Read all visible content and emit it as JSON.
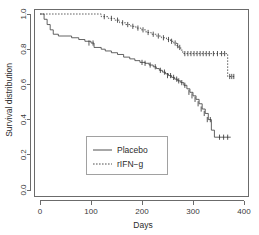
{
  "chart_data": {
    "type": "line",
    "title": "",
    "xlabel": "Days",
    "ylabel": "Survival distribution",
    "xlim": [
      0,
      400
    ],
    "ylim": [
      0.0,
      1.0
    ],
    "xticks": [
      "0",
      "100",
      "200",
      "300",
      "400"
    ],
    "xtick_values": [
      0,
      100,
      200,
      300,
      400
    ],
    "yticks": [
      "0.0",
      "0.2",
      "0.4",
      "0.6",
      "0.8",
      "1.0"
    ],
    "ytick_values": [
      0.0,
      0.2,
      0.4,
      0.6,
      0.8,
      1.0
    ],
    "grid": false,
    "legend_position": "center-left",
    "series": [
      {
        "name": "Placebo",
        "style": "solid",
        "steps": [
          [
            0,
            1.0
          ],
          [
            8,
            0.97
          ],
          [
            14,
            0.94
          ],
          [
            20,
            0.91
          ],
          [
            26,
            0.885
          ],
          [
            36,
            0.875
          ],
          [
            62,
            0.865
          ],
          [
            76,
            0.855
          ],
          [
            88,
            0.845
          ],
          [
            100,
            0.835
          ],
          [
            106,
            0.81
          ],
          [
            120,
            0.8
          ],
          [
            128,
            0.79
          ],
          [
            140,
            0.78
          ],
          [
            152,
            0.77
          ],
          [
            164,
            0.755
          ],
          [
            176,
            0.745
          ],
          [
            186,
            0.735
          ],
          [
            196,
            0.725
          ],
          [
            206,
            0.72
          ],
          [
            214,
            0.71
          ],
          [
            222,
            0.7
          ],
          [
            228,
            0.69
          ],
          [
            234,
            0.68
          ],
          [
            240,
            0.67
          ],
          [
            246,
            0.66
          ],
          [
            252,
            0.65
          ],
          [
            258,
            0.64
          ],
          [
            264,
            0.63
          ],
          [
            270,
            0.62
          ],
          [
            276,
            0.61
          ],
          [
            282,
            0.595
          ],
          [
            288,
            0.575
          ],
          [
            294,
            0.555
          ],
          [
            300,
            0.535
          ],
          [
            306,
            0.515
          ],
          [
            312,
            0.49
          ],
          [
            318,
            0.46
          ],
          [
            324,
            0.435
          ],
          [
            330,
            0.4
          ],
          [
            336,
            0.34
          ],
          [
            342,
            0.3
          ],
          [
            374,
            0.3
          ]
        ],
        "censored": [
          [
            96,
            0.835
          ],
          [
            104,
            0.835
          ],
          [
            200,
            0.725
          ],
          [
            206,
            0.72
          ],
          [
            216,
            0.71
          ],
          [
            226,
            0.7
          ],
          [
            236,
            0.68
          ],
          [
            244,
            0.67
          ],
          [
            250,
            0.65
          ],
          [
            256,
            0.65
          ],
          [
            262,
            0.64
          ],
          [
            268,
            0.63
          ],
          [
            272,
            0.62
          ],
          [
            278,
            0.61
          ],
          [
            284,
            0.595
          ],
          [
            292,
            0.555
          ],
          [
            298,
            0.535
          ],
          [
            304,
            0.515
          ],
          [
            310,
            0.49
          ],
          [
            316,
            0.46
          ],
          [
            322,
            0.435
          ],
          [
            328,
            0.4
          ],
          [
            334,
            0.4
          ],
          [
            352,
            0.3
          ],
          [
            360,
            0.3
          ],
          [
            368,
            0.3
          ]
        ]
      },
      {
        "name": "rIFN-g",
        "style": "dashed",
        "steps": [
          [
            0,
            1.0
          ],
          [
            108,
            1.0
          ],
          [
            120,
            0.985
          ],
          [
            134,
            0.975
          ],
          [
            146,
            0.965
          ],
          [
            156,
            0.95
          ],
          [
            168,
            0.94
          ],
          [
            178,
            0.93
          ],
          [
            188,
            0.92
          ],
          [
            198,
            0.91
          ],
          [
            208,
            0.895
          ],
          [
            218,
            0.885
          ],
          [
            228,
            0.875
          ],
          [
            238,
            0.865
          ],
          [
            248,
            0.855
          ],
          [
            256,
            0.845
          ],
          [
            262,
            0.835
          ],
          [
            268,
            0.82
          ],
          [
            272,
            0.81
          ],
          [
            276,
            0.795
          ],
          [
            280,
            0.775
          ],
          [
            364,
            0.775
          ],
          [
            368,
            0.645
          ],
          [
            382,
            0.645
          ]
        ],
        "censored": [
          [
            126,
            0.985
          ],
          [
            140,
            0.975
          ],
          [
            152,
            0.965
          ],
          [
            162,
            0.95
          ],
          [
            172,
            0.94
          ],
          [
            182,
            0.93
          ],
          [
            192,
            0.92
          ],
          [
            202,
            0.91
          ],
          [
            212,
            0.895
          ],
          [
            222,
            0.885
          ],
          [
            232,
            0.875
          ],
          [
            242,
            0.865
          ],
          [
            252,
            0.855
          ],
          [
            258,
            0.845
          ],
          [
            265,
            0.835
          ],
          [
            270,
            0.82
          ],
          [
            274,
            0.81
          ],
          [
            284,
            0.775
          ],
          [
            290,
            0.775
          ],
          [
            296,
            0.775
          ],
          [
            302,
            0.775
          ],
          [
            308,
            0.775
          ],
          [
            314,
            0.775
          ],
          [
            320,
            0.775
          ],
          [
            326,
            0.775
          ],
          [
            332,
            0.775
          ],
          [
            340,
            0.775
          ],
          [
            348,
            0.775
          ],
          [
            356,
            0.775
          ],
          [
            362,
            0.775
          ],
          [
            372,
            0.645
          ],
          [
            376,
            0.645
          ],
          [
            380,
            0.645
          ]
        ]
      }
    ]
  },
  "legend": {
    "items": [
      {
        "label": "Placebo",
        "style": "solid"
      },
      {
        "label": "rIFN−g",
        "style": "dashed"
      }
    ]
  },
  "axes": {
    "x_title": "Days",
    "y_title": "Survival distribution"
  }
}
